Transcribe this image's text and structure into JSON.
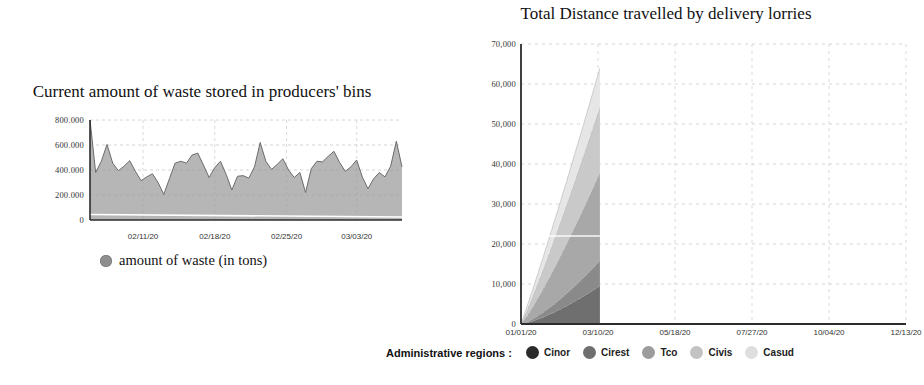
{
  "charts": {
    "waste": {
      "title": "Current amount of waste stored in producers' bins",
      "legend_label": "amount of waste (in tons)",
      "legend_swatch_color": "#8e8e8e",
      "yticks": [
        "0",
        "200.000",
        "400.000",
        "600.000",
        "800.000"
      ],
      "xticks": [
        "02/11/20",
        "02/18/20",
        "02/25/20",
        "03/03/20"
      ]
    },
    "distance": {
      "title": "Total Distance travelled by delivery lorries",
      "legend_caption": "Administrative regions :",
      "yticks": [
        "0",
        "10,000",
        "20,000",
        "30,000",
        "40,000",
        "50,000",
        "60,000",
        "70,000"
      ],
      "xticks": [
        "01/01/20",
        "03/10/20",
        "05/18/20",
        "07/27/20",
        "10/04/20",
        "12/13/20"
      ],
      "legend": [
        {
          "label": "Cinor",
          "color": "#2b2b2b"
        },
        {
          "label": "Cirest",
          "color": "#6f6f6f"
        },
        {
          "label": "Tco",
          "color": "#9c9c9c"
        },
        {
          "label": "Civis",
          "color": "#c2c2c2"
        },
        {
          "label": "Casud",
          "color": "#dedede"
        }
      ]
    }
  },
  "chart_data": [
    {
      "type": "area",
      "id": "waste",
      "title": "Current amount of waste stored in producers' bins",
      "xlabel": "",
      "ylabel": "",
      "ylim": [
        0,
        800000
      ],
      "yticks": [
        0,
        200000,
        400000,
        600000,
        800000
      ],
      "ytick_labels": [
        "0",
        "200.000",
        "400.000",
        "600.000",
        "800.000"
      ],
      "xtick_labels": [
        "02/11/20",
        "02/18/20",
        "02/25/20",
        "03/03/20"
      ],
      "xtick_positions": [
        0.17,
        0.4,
        0.63,
        0.855
      ],
      "grid": true,
      "legend_position": "below",
      "series": [
        {
          "name": "amount of waste (in tons)",
          "color": "#9a9a9a",
          "values": [
            800000,
            380000,
            470000,
            605000,
            455000,
            395000,
            430000,
            475000,
            390000,
            315000,
            345000,
            370000,
            300000,
            205000,
            330000,
            455000,
            470000,
            455000,
            520000,
            535000,
            440000,
            340000,
            420000,
            470000,
            365000,
            240000,
            350000,
            355000,
            335000,
            425000,
            620000,
            470000,
            405000,
            445000,
            490000,
            400000,
            340000,
            380000,
            220000,
            410000,
            470000,
            465000,
            510000,
            550000,
            460000,
            390000,
            425000,
            480000,
            345000,
            250000,
            330000,
            380000,
            345000,
            430000,
            630000,
            425000
          ]
        }
      ]
    },
    {
      "type": "area",
      "stacked": true,
      "id": "distance",
      "title": "Total Distance travelled by delivery lorries",
      "xlabel": "",
      "ylabel": "",
      "ylim": [
        0,
        70000
      ],
      "yticks": [
        0,
        10000,
        20000,
        30000,
        40000,
        50000,
        60000,
        70000
      ],
      "ytick_labels": [
        "0",
        "10,000",
        "20,000",
        "30,000",
        "40,000",
        "50,000",
        "60,000",
        "70,000"
      ],
      "xtick_labels": [
        "01/01/20",
        "03/10/20",
        "05/18/20",
        "07/27/20",
        "10/04/20",
        "12/13/20"
      ],
      "x_fraction_of_axis": [
        0.0,
        0.2,
        0.4,
        0.6,
        0.8,
        1.0
      ],
      "data_end_x_fraction": 0.205,
      "grid": true,
      "legend_position": "below",
      "series": [
        {
          "name": "Cinor",
          "color": "#6f6f6f",
          "end_value": 9500
        },
        {
          "name": "Cirest",
          "color": "#8a8a8a",
          "end_value": 6300
        },
        {
          "name": "Tco",
          "color": "#a8a8a8",
          "end_value": 22000
        },
        {
          "name": "Civis",
          "color": "#c9c9c9",
          "end_value": 16500
        },
        {
          "name": "Casud",
          "color": "#e6e6e6",
          "end_value": 9700
        }
      ],
      "total_end_value": 64000
    }
  ]
}
